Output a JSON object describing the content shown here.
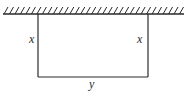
{
  "diagram": {
    "wall": {
      "x1": 3,
      "x2": 184,
      "y": 14,
      "hatch_count": 33,
      "hatch_height": 7
    },
    "enclosure": {
      "left_x": 38,
      "right_x": 148,
      "top_y": 14,
      "bottom_y": 77
    },
    "labels": {
      "left_side": "x",
      "right_side": "x",
      "bottom_side": "y"
    },
    "colors": {
      "line": "#2a2a2a",
      "background": "#ffffff"
    }
  }
}
